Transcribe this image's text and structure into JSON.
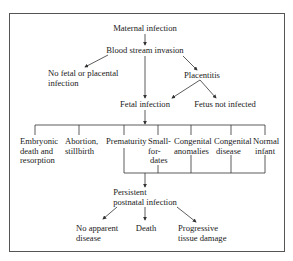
{
  "diagram": {
    "nodes": {
      "maternal_infection": "Maternal infection",
      "blood_stream_invasion": "Blood stream invasion",
      "no_fetal_placental_1": "No fetal or placental",
      "no_fetal_placental_2": "infection",
      "placentitis": "Placentitis",
      "fetal_infection": "Fetal infection",
      "fetus_not_infected": "Fetus not infected",
      "embryonic_1": "Embryonic",
      "embryonic_2": "death and",
      "embryonic_3": "resorption",
      "abortion_1": "Abortion,",
      "abortion_2": "stillbirth",
      "prematurity": "Prematurity",
      "sfd_1": "Small-",
      "sfd_2": "for-",
      "sfd_3": "dates",
      "cong_anom_1": "Congenital",
      "cong_anom_2": "anomalies",
      "cong_dis_1": "Congenital",
      "cong_dis_2": "disease",
      "normal_1": "Normal",
      "normal_2": "infant",
      "persistent_1": "Persistent",
      "persistent_2": "postnatal infection",
      "no_apparent_1": "No apparent",
      "no_apparent_2": "disease",
      "death": "Death",
      "progressive_1": "Progressive",
      "progressive_2": "tissue damage"
    },
    "line_color": "#333333"
  }
}
